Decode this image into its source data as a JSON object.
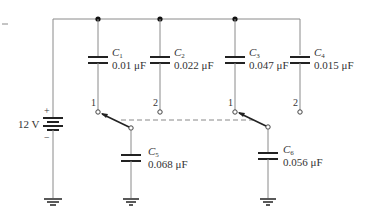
{
  "battery": {
    "label": "12 V",
    "plus": "+",
    "minus": "−"
  },
  "capacitors": [
    {
      "name": "C",
      "sub": "1",
      "value": "0.01 μF"
    },
    {
      "name": "C",
      "sub": "2",
      "value": "0.022 μF"
    },
    {
      "name": "C",
      "sub": "3",
      "value": "0.047 μF"
    },
    {
      "name": "C",
      "sub": "4",
      "value": "0.015 μF"
    },
    {
      "name": "C",
      "sub": "5",
      "value": "0.068 μF"
    },
    {
      "name": "C",
      "sub": "6",
      "value": "0.056 μF"
    }
  ],
  "terminals": {
    "t1": "1",
    "t2": "2",
    "t3": "1",
    "t4": "2"
  },
  "colors": {
    "wire": "#8a8a8a",
    "plate": "#222222",
    "text": "#333333"
  }
}
